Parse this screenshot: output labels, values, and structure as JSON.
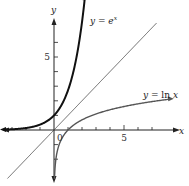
{
  "chart_data": {
    "type": "line",
    "title": "",
    "xlabel": "x",
    "ylabel": "y",
    "origin_label": "0",
    "xlim": [
      -3.5,
      8.9
    ],
    "ylim": [
      -3.3,
      7.5
    ],
    "x_ticks": [
      -3,
      -2,
      -1,
      1,
      2,
      3,
      4,
      5,
      6,
      7
    ],
    "x_tick_labels": [
      {
        "value": 5,
        "label": "5"
      }
    ],
    "y_ticks": [
      -2,
      -1,
      1,
      2,
      3,
      4,
      5,
      6
    ],
    "y_tick_labels": [
      {
        "value": 5,
        "label": "5"
      }
    ],
    "grid": false,
    "series": [
      {
        "name": "y = e^x",
        "label_parts": [
          "y",
          " = ",
          "e",
          "x"
        ],
        "function": "exp",
        "x_range": [
          -3.5,
          2.2
        ],
        "color": "#111111",
        "style": "thick"
      },
      {
        "name": "y = x",
        "function": "identity",
        "x_range": [
          -3.3,
          7.3
        ],
        "color": "#444444",
        "style": "thin"
      },
      {
        "name": "y = ln x",
        "label_parts": [
          "y",
          " = ln ",
          "x"
        ],
        "function": "ln",
        "x_range": [
          0.03,
          8.2
        ],
        "color": "#555555",
        "style": "medium"
      }
    ]
  }
}
